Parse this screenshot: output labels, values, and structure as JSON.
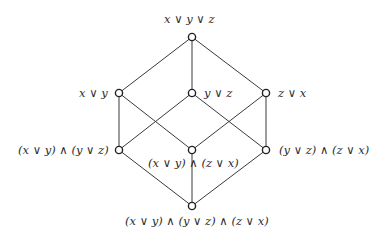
{
  "diagram": {
    "type": "hasse-diagram",
    "colors": {
      "edge": "#3a3a3a",
      "node_stroke": "#222222",
      "node_fill": "#ffffff",
      "text": "#2b2b2b"
    },
    "nodes": [
      {
        "id": "top",
        "label": "x ∨ y ∨ z",
        "x": 192,
        "y": 37
      },
      {
        "id": "xy",
        "label": "x ∨ y",
        "x": 119,
        "y": 93
      },
      {
        "id": "yz",
        "label": "y ∨ z",
        "x": 192,
        "y": 93
      },
      {
        "id": "zx",
        "label": "z ∨ x",
        "x": 266,
        "y": 93
      },
      {
        "id": "xy_yz",
        "label": "(x ∨ y) ∧ (y ∨ z)",
        "x": 119,
        "y": 150
      },
      {
        "id": "xy_zx",
        "label": "(x ∨ y) ∧ (z ∨ x)",
        "x": 192,
        "y": 150
      },
      {
        "id": "yz_zx",
        "label": "(y ∨ z) ∧ (z ∨ x)",
        "x": 266,
        "y": 150
      },
      {
        "id": "bottom",
        "label": "(x ∨ y) ∧ (y ∨ z) ∧ (z ∨ x)",
        "x": 192,
        "y": 206
      }
    ],
    "edges": [
      [
        "top",
        "xy"
      ],
      [
        "top",
        "yz"
      ],
      [
        "top",
        "zx"
      ],
      [
        "xy",
        "xy_yz"
      ],
      [
        "xy",
        "xy_zx"
      ],
      [
        "yz",
        "xy_yz"
      ],
      [
        "yz",
        "yz_zx"
      ],
      [
        "zx",
        "xy_zx"
      ],
      [
        "zx",
        "yz_zx"
      ],
      [
        "xy_yz",
        "bottom"
      ],
      [
        "xy_zx",
        "bottom"
      ],
      [
        "yz_zx",
        "bottom"
      ]
    ]
  }
}
